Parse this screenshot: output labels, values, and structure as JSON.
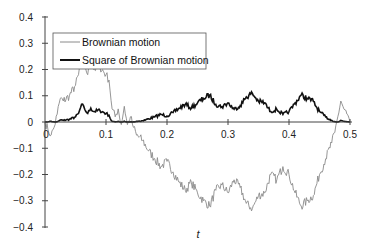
{
  "chart_data": {
    "type": "line",
    "title": "",
    "xlabel": "t",
    "ylabel": "",
    "xlim": [
      0,
      0.5
    ],
    "ylim": [
      -0.4,
      0.4
    ],
    "grid": false,
    "legend_position": "top-left",
    "xticks": [
      0,
      0.1,
      0.2,
      0.3,
      0.4,
      0.5
    ],
    "xtick_labels": [
      "0",
      "0.1",
      "0.2",
      "0.3",
      "0.4",
      "0.5"
    ],
    "yticks": [
      0.4,
      0.3,
      0.2,
      0.1,
      0,
      -0.1,
      -0.2,
      -0.3,
      -0.4
    ],
    "ytick_labels": [
      "0.4",
      "0.3",
      "0.2",
      "0.1",
      "0",
      "−0.1",
      "−0.2",
      "−0.3",
      "−0.4"
    ],
    "series": [
      {
        "name": "Brownian motion",
        "color": "#8a8a8a",
        "x": [
          0,
          0.005,
          0.01,
          0.015,
          0.02,
          0.025,
          0.03,
          0.04,
          0.05,
          0.055,
          0.06,
          0.065,
          0.07,
          0.075,
          0.08,
          0.09,
          0.1,
          0.105,
          0.11,
          0.115,
          0.12,
          0.125,
          0.13,
          0.135,
          0.14,
          0.145,
          0.15,
          0.16,
          0.17,
          0.18,
          0.19,
          0.2,
          0.21,
          0.22,
          0.23,
          0.24,
          0.25,
          0.26,
          0.27,
          0.28,
          0.29,
          0.3,
          0.31,
          0.32,
          0.33,
          0.34,
          0.35,
          0.36,
          0.37,
          0.38,
          0.39,
          0.4,
          0.41,
          0.42,
          0.43,
          0.44,
          0.45,
          0.46,
          0.47,
          0.475,
          0.48,
          0.485,
          0.49,
          0.495,
          0.5
        ],
        "values": [
          0,
          -0.03,
          -0.05,
          -0.02,
          0.03,
          0.09,
          0.08,
          0.1,
          0.14,
          0.18,
          0.26,
          0.22,
          0.18,
          0.23,
          0.2,
          0.21,
          0.18,
          0.16,
          0.05,
          0.02,
          0.05,
          -0.01,
          0.06,
          -0.01,
          0.02,
          -0.02,
          -0.05,
          -0.07,
          -0.11,
          -0.14,
          -0.17,
          -0.15,
          -0.19,
          -0.23,
          -0.26,
          -0.23,
          -0.27,
          -0.3,
          -0.32,
          -0.26,
          -0.24,
          -0.27,
          -0.22,
          -0.25,
          -0.31,
          -0.33,
          -0.28,
          -0.27,
          -0.2,
          -0.22,
          -0.17,
          -0.2,
          -0.27,
          -0.32,
          -0.3,
          -0.28,
          -0.2,
          -0.14,
          -0.08,
          -0.04,
          0.02,
          0.08,
          0.05,
          0.03,
          0.0
        ]
      },
      {
        "name": "Square of Brownian motion",
        "color": "#111111",
        "derived_from": "square of Brownian motion values"
      }
    ]
  }
}
